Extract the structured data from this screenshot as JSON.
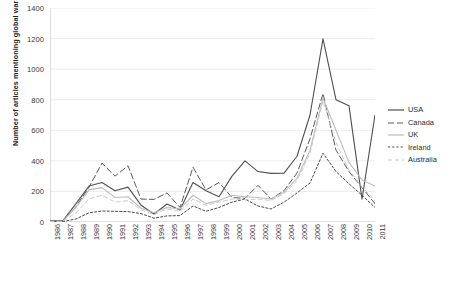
{
  "chart_data": {
    "type": "line",
    "title": "",
    "xlabel": "",
    "ylabel": "Number of articles mentioning global warming",
    "ylim": [
      0,
      1400
    ],
    "ytick_step": 200,
    "yticks": [
      0,
      200,
      400,
      600,
      800,
      1000,
      1200,
      1400
    ],
    "grid": true,
    "legend_position": "right",
    "categories": [
      "1986",
      "1987",
      "1988",
      "1989",
      "1990",
      "1991",
      "1992",
      "1993",
      "1994",
      "1995",
      "1996",
      "1997",
      "1998",
      "1999",
      "2000",
      "2001",
      "2002",
      "2003",
      "2004",
      "2005",
      "2006",
      "2007",
      "2008",
      "2009",
      "2010",
      "2011"
    ],
    "series": [
      {
        "name": "USA",
        "color": "#4f4f4f",
        "dash": "none",
        "width": 1.1,
        "values": [
          8,
          10,
          120,
          235,
          258,
          205,
          228,
          110,
          52,
          118,
          78,
          258,
          205,
          165,
          300,
          400,
          330,
          318,
          320,
          430,
          700,
          1198,
          800,
          760,
          150,
          700
        ]
      },
      {
        "name": "Canada",
        "color": "#5a5a5a",
        "dash": "long",
        "width": 1.0,
        "values": [
          6,
          8,
          100,
          228,
          385,
          300,
          368,
          150,
          148,
          190,
          95,
          358,
          210,
          258,
          160,
          155,
          240,
          150,
          205,
          320,
          545,
          840,
          470,
          330,
          225,
          120
        ]
      },
      {
        "name": "UK",
        "color": "#bdbdbd",
        "dash": "none",
        "width": 1.1,
        "values": [
          5,
          7,
          95,
          210,
          225,
          160,
          165,
          90,
          60,
          95,
          85,
          175,
          120,
          140,
          175,
          165,
          160,
          150,
          195,
          285,
          470,
          810,
          600,
          390,
          275,
          235
        ]
      },
      {
        "name": "Ireland",
        "color": "#4a4a4a",
        "dash": "short",
        "width": 1.0,
        "values": [
          2,
          3,
          20,
          60,
          72,
          70,
          68,
          55,
          25,
          40,
          42,
          105,
          70,
          95,
          130,
          150,
          105,
          85,
          130,
          190,
          255,
          450,
          330,
          250,
          175,
          95
        ]
      },
      {
        "name": "Australia",
        "color": "#c9c9c9",
        "dash": "medium",
        "width": 1.0,
        "values": [
          3,
          5,
          60,
          150,
          175,
          130,
          140,
          80,
          48,
          85,
          70,
          150,
          110,
          130,
          150,
          145,
          150,
          140,
          185,
          270,
          450,
          795,
          520,
          340,
          230,
          140
        ]
      }
    ]
  },
  "legend": {
    "items": [
      {
        "label": "USA"
      },
      {
        "label": "Canada"
      },
      {
        "label": "UK"
      },
      {
        "label": "Ireland"
      },
      {
        "label": "Australia"
      }
    ]
  },
  "caption": {
    "text": ""
  },
  "colors": {
    "gridline": "#e3e3e3",
    "axis": "#b0b0b0",
    "background": "#ffffff"
  }
}
